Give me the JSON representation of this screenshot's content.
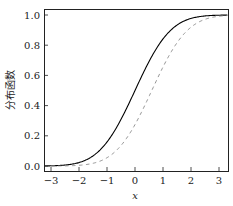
{
  "chart_data": {
    "type": "line",
    "title": "",
    "xlabel": "x",
    "ylabel": "分布函数",
    "xlim": [
      -3.25,
      3.3
    ],
    "ylim": [
      -0.03,
      1.04
    ],
    "xticks": [
      -3,
      -2,
      -1,
      0,
      1,
      2,
      3
    ],
    "xtick_labels": [
      "−3",
      "−2",
      "−1",
      "0",
      "1",
      "2",
      "3"
    ],
    "yticks": [
      0.0,
      0.2,
      0.4,
      0.6,
      0.8,
      1.0
    ],
    "ytick_labels": [
      "0.0",
      "0.2",
      "0.4",
      "0.6",
      "0.8",
      "1.0"
    ],
    "grid": false,
    "legend": null,
    "series": [
      {
        "name": "solid",
        "style": "solid",
        "color": "#000000",
        "description": "Normal CDF, mean 0, sd 1",
        "mean": 0,
        "sd": 1,
        "x": [
          -3.25,
          -3,
          -2.5,
          -2,
          -1.5,
          -1,
          -0.5,
          0,
          0.5,
          1,
          1.5,
          2,
          2.5,
          3,
          3.25
        ],
        "y": [
          0.001,
          0.001,
          0.006,
          0.023,
          0.067,
          0.159,
          0.309,
          0.5,
          0.691,
          0.841,
          0.933,
          0.977,
          0.994,
          0.999,
          0.999
        ]
      },
      {
        "name": "dashed",
        "style": "dashed",
        "color": "#888888",
        "description": "Normal CDF shifted right, mean ~0.6, sd 1",
        "mean": 0.6,
        "sd": 1,
        "x": [
          -3.25,
          -3,
          -2.5,
          -2,
          -1.5,
          -1,
          -0.5,
          0,
          0.5,
          1,
          1.5,
          2,
          2.5,
          3,
          3.25
        ],
        "y": [
          0.0,
          0.0,
          0.001,
          0.005,
          0.018,
          0.055,
          0.136,
          0.274,
          0.46,
          0.655,
          0.816,
          0.919,
          0.971,
          0.992,
          0.996
        ]
      }
    ]
  }
}
